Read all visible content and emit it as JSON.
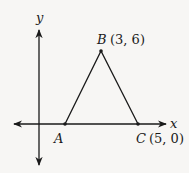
{
  "diagram": {
    "type": "coordinate-plane-triangle",
    "axes": {
      "x_label": "x",
      "y_label": "y"
    },
    "points": [
      {
        "name": "A",
        "coords": "",
        "label": "A"
      },
      {
        "name": "B",
        "coords": "(3, 6)",
        "label": "B"
      },
      {
        "name": "C",
        "coords": "(5, 0)",
        "label": "C"
      }
    ],
    "segments": [
      "AB",
      "BC",
      "CA"
    ],
    "colors": {
      "stroke": "#1a1a1a",
      "background": "#f7f6f4"
    }
  }
}
